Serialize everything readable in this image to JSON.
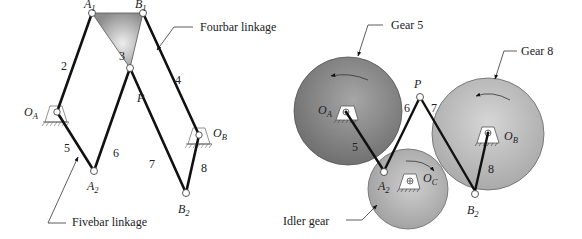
{
  "left_diagram": {
    "callouts": {
      "fourbar": "Fourbar linkage",
      "fivebar": "Fivebar linkage"
    },
    "points": {
      "A1": {
        "main": "A",
        "sub": "1"
      },
      "B1": {
        "main": "B",
        "sub": "1"
      },
      "P": {
        "main": "P",
        "sub": ""
      },
      "OA": {
        "main": "O",
        "sub": "A"
      },
      "OB": {
        "main": "O",
        "sub": "B"
      },
      "A2": {
        "main": "A",
        "sub": "2"
      },
      "B2": {
        "main": "B",
        "sub": "2"
      }
    },
    "links": [
      "2",
      "3",
      "4",
      "5",
      "6",
      "7",
      "8"
    ]
  },
  "right_diagram": {
    "callouts": {
      "gear5": "Gear 5",
      "gear8": "Gear 8",
      "idler": "Idler gear"
    },
    "points": {
      "P": {
        "main": "P",
        "sub": ""
      },
      "OA": {
        "main": "O",
        "sub": "A"
      },
      "OB": {
        "main": "O",
        "sub": "B"
      },
      "OC": {
        "main": "O",
        "sub": "C"
      },
      "A2": {
        "main": "A",
        "sub": "2"
      },
      "B2": {
        "main": "B",
        "sub": "2"
      }
    },
    "links": [
      "5",
      "6",
      "7",
      "8"
    ]
  },
  "colors": {
    "link": "#111111",
    "coupler": "#9a9a9a",
    "gear5": "#7e7e7e",
    "gear8": "#b4b4b4",
    "idler": "#a8a8a8"
  }
}
